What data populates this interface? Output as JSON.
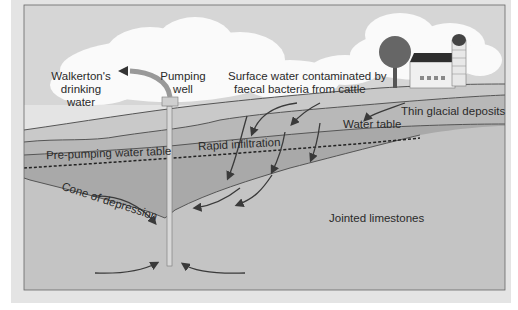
{
  "diagram": {
    "labels": {
      "drinking_water": [
        "Walkerton's",
        "drinking",
        "water"
      ],
      "pumping_well": [
        "Pumping",
        "well"
      ],
      "surface_water": [
        "Surface water contaminated by",
        "faecal bacteria from cattle"
      ],
      "thin_glacial": "Thin glacial deposits",
      "water_table": "Water table",
      "pre_pumping": "Pre-pumping water table",
      "rapid_infiltration": "Rapid infiltration",
      "cone": "Cone of depression",
      "limestones": "Jointed limestones"
    },
    "colors": {
      "background": "#e4e4e4",
      "sky": "#d6d6d6",
      "cloud": "#fafafa",
      "glacial": "#b8b8b8",
      "saturated": "#a9a9a9",
      "limestone": "#c4c4c4",
      "line": "#444444",
      "barn_roof": "#2e2e2e"
    },
    "icons": [
      "tree-icon",
      "barn-icon",
      "silo-icon",
      "well-head-icon",
      "flow-arrow-icon"
    ]
  }
}
